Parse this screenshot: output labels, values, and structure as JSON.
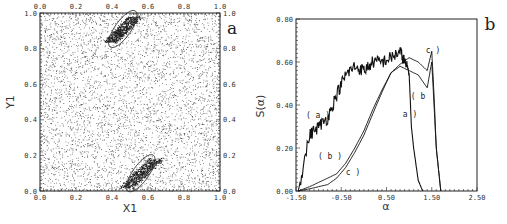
{
  "chart_data": [
    {
      "panel": "a",
      "type": "scatter",
      "title": "",
      "xlabel": "X1",
      "ylabel": "Y1",
      "xlim": [
        0.0,
        1.0
      ],
      "ylim": [
        0.0,
        1.0
      ],
      "x_ticks": [
        "0.0",
        "0.2",
        "0.4",
        "0.6",
        "0.8",
        "1.0"
      ],
      "y_ticks": [
        "0.0",
        "0.2",
        "0.4",
        "0.6",
        "0.8",
        "1.0"
      ],
      "grid": false,
      "description": "Uniformly scattered points over unit square with two dense elongated clusters",
      "clusters": [
        {
          "name": "top",
          "x_range": [
            0.36,
            0.56
          ],
          "y_range": [
            0.82,
            1.0
          ]
        },
        {
          "name": "bottom",
          "x_range": [
            0.44,
            0.68
          ],
          "y_range": [
            0.0,
            0.2
          ]
        }
      ]
    },
    {
      "panel": "b",
      "type": "line",
      "title": "",
      "xlabel": "α",
      "ylabel": "S(α)",
      "xlim": [
        -1.5,
        2.5
      ],
      "ylim": [
        0.0,
        0.8
      ],
      "x_ticks": [
        "-1.50",
        "-0.50",
        "0.50",
        "1.50",
        "2.50"
      ],
      "y_ticks": [
        "0.00",
        "0.20",
        "0.40",
        "0.60",
        "0.80"
      ],
      "grid": false,
      "series": [
        {
          "name": "(a)",
          "x": [
            -1.45,
            -1.2,
            -1.0,
            -0.8,
            -0.6,
            -0.4,
            -0.2,
            0.0,
            0.2,
            0.4,
            0.6,
            0.8,
            0.9,
            1.0,
            1.05,
            1.1,
            1.2,
            1.3
          ],
          "y": [
            0.0,
            0.26,
            0.3,
            0.34,
            0.45,
            0.54,
            0.58,
            0.56,
            0.6,
            0.6,
            0.62,
            0.65,
            0.6,
            0.55,
            0.3,
            0.2,
            0.05,
            0.0
          ]
        },
        {
          "name": "(b)",
          "x": [
            -1.45,
            -1.2,
            -1.0,
            -0.8,
            -0.6,
            -0.4,
            -0.2,
            0.0,
            0.2,
            0.4,
            0.6,
            0.8,
            1.0,
            1.2,
            1.4,
            1.5,
            1.55,
            1.6,
            1.7
          ],
          "y": [
            0.0,
            0.02,
            0.04,
            0.06,
            0.08,
            0.13,
            0.2,
            0.28,
            0.38,
            0.47,
            0.55,
            0.58,
            0.56,
            0.54,
            0.48,
            0.6,
            0.4,
            0.2,
            0.0
          ]
        },
        {
          "name": "(c)",
          "x": [
            -1.45,
            -1.2,
            -1.0,
            -0.8,
            -0.6,
            -0.4,
            -0.2,
            0.0,
            0.2,
            0.4,
            0.6,
            0.8,
            1.0,
            1.2,
            1.4,
            1.5,
            1.55,
            1.6,
            1.7
          ],
          "y": [
            0.0,
            0.01,
            0.02,
            0.03,
            0.06,
            0.11,
            0.18,
            0.26,
            0.36,
            0.46,
            0.55,
            0.59,
            0.62,
            0.6,
            0.56,
            0.65,
            0.45,
            0.2,
            0.0
          ]
        }
      ],
      "annotations": [
        "(a)",
        "(b)",
        "(c)",
        "a)",
        "(b",
        "c)"
      ]
    }
  ],
  "panel_a": {
    "label": "a",
    "xlabel": "X1",
    "ylabel": "Y1"
  },
  "panel_b": {
    "label": "b",
    "xlabel": "α",
    "ylabel": "S(α)"
  }
}
